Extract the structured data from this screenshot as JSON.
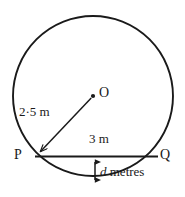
{
  "figure": {
    "background_color": "#ffffff",
    "stroke_color": "#1a1a1a",
    "text_color": "#1a1a1a",
    "points": {
      "center_label": "O",
      "left_label": "P",
      "right_label": "Q"
    },
    "dimensions": {
      "radius_label": "2·5 m",
      "radius_value": 2.5,
      "radius_units": "m",
      "chord_label": "3 m",
      "chord_value": 3,
      "chord_units": "m",
      "depth_variable": "d",
      "depth_label_suffix": "metres",
      "depth_label": "d metres"
    },
    "geometry": {
      "circle_center_x": 93,
      "circle_center_y": 96,
      "circle_radius": 80,
      "point_P_x": 36,
      "point_P_y": 156,
      "point_Q_x": 157,
      "point_Q_y": 156,
      "arrow_x": 95,
      "arrow_top_y": 157,
      "arrow_bottom_y": 185
    }
  }
}
